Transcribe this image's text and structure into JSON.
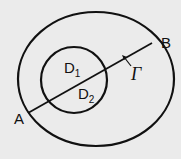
{
  "diagram": {
    "labels": {
      "point_a": "A",
      "point_b": "B",
      "curve": "Γ",
      "region_1_base": "D",
      "region_1_sub": "1",
      "region_2_base": "D",
      "region_2_sub": "2"
    },
    "colors": {
      "background": "#ebebeb",
      "stroke": "#111111"
    }
  }
}
